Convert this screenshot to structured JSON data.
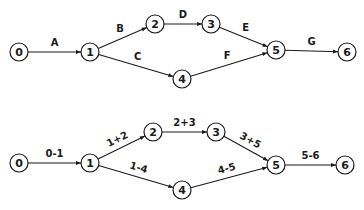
{
  "diagrams": [
    {
      "name": "activity-letter-network",
      "nodes": [
        {
          "id": "0",
          "label": "0",
          "x": 19,
          "y": 52
        },
        {
          "id": "1",
          "label": "1",
          "x": 90,
          "y": 52
        },
        {
          "id": "2",
          "label": "2",
          "x": 155,
          "y": 24
        },
        {
          "id": "3",
          "label": "3",
          "x": 211,
          "y": 24
        },
        {
          "id": "4",
          "label": "4",
          "x": 182,
          "y": 79
        },
        {
          "id": "5",
          "label": "5",
          "x": 276,
          "y": 50
        },
        {
          "id": "6",
          "label": "6",
          "x": 347,
          "y": 52
        }
      ],
      "edges": [
        {
          "from": "0",
          "to": "1",
          "label": "A"
        },
        {
          "from": "1",
          "to": "2",
          "label": "B"
        },
        {
          "from": "1",
          "to": "4",
          "label": "C"
        },
        {
          "from": "2",
          "to": "3",
          "label": "D"
        },
        {
          "from": "3",
          "to": "5",
          "label": "E"
        },
        {
          "from": "4",
          "to": "5",
          "label": "F"
        },
        {
          "from": "5",
          "to": "6",
          "label": "G"
        }
      ]
    },
    {
      "name": "activity-node-pair-network",
      "nodes": [
        {
          "id": "0",
          "label": "0",
          "x": 19,
          "y": 163
        },
        {
          "id": "1",
          "label": "1",
          "x": 90,
          "y": 163
        },
        {
          "id": "2",
          "label": "2",
          "x": 153,
          "y": 132
        },
        {
          "id": "3",
          "label": "3",
          "x": 216,
          "y": 132
        },
        {
          "id": "4",
          "label": "4",
          "x": 182,
          "y": 190
        },
        {
          "id": "5",
          "label": "5",
          "x": 276,
          "y": 165
        },
        {
          "id": "6",
          "label": "6",
          "x": 345,
          "y": 165
        }
      ],
      "edges": [
        {
          "from": "0",
          "to": "1",
          "label": "0-1"
        },
        {
          "from": "1",
          "to": "2",
          "label": "1+2"
        },
        {
          "from": "1",
          "to": "4",
          "label": "1-4"
        },
        {
          "from": "2",
          "to": "3",
          "label": "2+3"
        },
        {
          "from": "3",
          "to": "5",
          "label": "3+5"
        },
        {
          "from": "4",
          "to": "5",
          "label": "4-5"
        },
        {
          "from": "5",
          "to": "6",
          "label": "5-6"
        }
      ]
    }
  ]
}
